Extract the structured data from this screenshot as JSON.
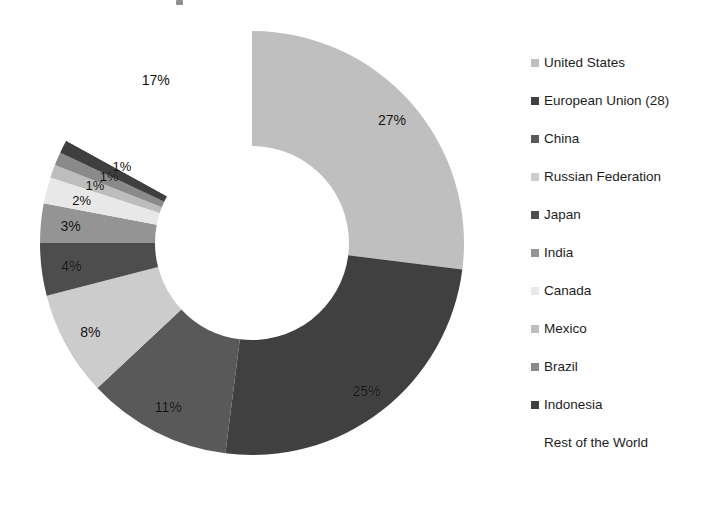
{
  "chart_data": {
    "type": "pie",
    "variant": "donut",
    "title": "",
    "subtitle": "",
    "xlabel": "",
    "ylabel": "",
    "legend_position": "right",
    "grid": false,
    "value_unit": "%",
    "start_angle_deg": 0,
    "direction": "clockwise",
    "categories": [
      "United States",
      "European Union (28)",
      "China",
      "Russian Federation",
      "Japan",
      "India",
      "Canada",
      "Mexico",
      "Brazil",
      "Indonesia",
      "Rest of the World"
    ],
    "values": [
      27,
      25,
      11,
      8,
      4,
      3,
      2,
      1,
      1,
      1,
      17
    ],
    "data_labels": [
      "27%",
      "25%",
      "11%",
      "8%",
      "4%",
      "3%",
      "2%",
      "1%",
      "1%",
      "1%",
      "17%"
    ],
    "colors": [
      "#bfbfbf",
      "#404040",
      "#595959",
      "#cccccc",
      "#4d4d4d",
      "#949494",
      "#e8e8e8",
      "#bdbdbd",
      "#8a8a8a",
      "#3f3f3f",
      "#ffffff"
    ]
  },
  "legend": {
    "items": [
      {
        "label": "United States",
        "color": "#bfbfbf"
      },
      {
        "label": "European Union (28)",
        "color": "#404040"
      },
      {
        "label": "China",
        "color": "#595959"
      },
      {
        "label": "Russian Federation",
        "color": "#cccccc"
      },
      {
        "label": "Japan",
        "color": "#4d4d4d"
      },
      {
        "label": "India",
        "color": "#949494"
      },
      {
        "label": "Canada",
        "color": "#e8e8e8"
      },
      {
        "label": "Mexico",
        "color": "#bdbdbd"
      },
      {
        "label": "Brazil",
        "color": "#8a8a8a"
      },
      {
        "label": "Indonesia",
        "color": "#3f3f3f"
      },
      {
        "label": "Rest of the World",
        "color": "#ffffff"
      }
    ]
  },
  "geometry": {
    "center_x": 252,
    "center_y": 243,
    "outer_radius": 212,
    "inner_radius": 97
  }
}
